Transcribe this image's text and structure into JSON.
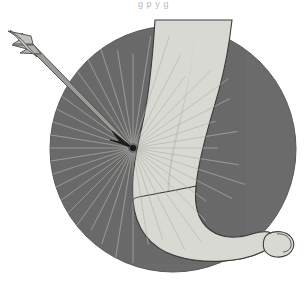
{
  "figure": {
    "caption_fragment": "g  p  y g",
    "background_color": "#ffffff",
    "parts": {
      "circle": {
        "label": "gray-circular-background",
        "fill": "#6b6b6b",
        "stroke": "#5a5a5a",
        "center_x": 173,
        "center_y": 149,
        "radius": 123
      },
      "leg": {
        "label": "lower-leg-shank",
        "fill": "#d9d9d3",
        "stroke": "#3c3c3c",
        "shade_fill": "#c3c3bd"
      },
      "foot": {
        "label": "foot-and-heel",
        "fill": "#d9d9d3",
        "stroke": "#3c3c3c"
      },
      "toe": {
        "label": "big-toe",
        "fill": "#d9d9d3",
        "stroke": "#3c3c3c"
      },
      "arrow": {
        "label": "arrow-projectile",
        "shaft_fill": "#9a9a96",
        "shaft_stroke": "#4a4a4a",
        "fletching_fill": "#b4b4b0",
        "fletching_stroke": "#4a4a4a",
        "tip_fill": "#1f1f1f",
        "nock_x": 10,
        "nock_y": 36,
        "tip_x": 133,
        "tip_y": 148
      },
      "impact": {
        "label": "impact-point",
        "x": 133,
        "y": 148,
        "dot_fill": "#1a1a1a",
        "ray_color": "#8d8d88",
        "ray_count": 40,
        "ray_length": 118
      }
    }
  }
}
